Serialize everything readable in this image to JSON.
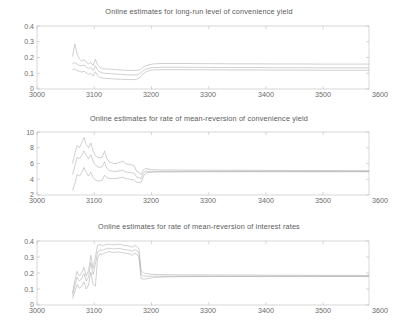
{
  "figure": {
    "background": "#ffffff",
    "axis_color": "#b9b9b9",
    "line_color": "#a8a8a8",
    "text_color": "#6b6b6b",
    "width": 398,
    "height": 325
  },
  "panels": [
    {
      "title": "Online estimates for long-run level of convenience yield",
      "yticks": [
        "0",
        "0.1",
        "0.2",
        "0.3",
        "0.4"
      ],
      "xticks": [
        "3000",
        "3100",
        "3200",
        "3300",
        "3400",
        "3500",
        "3600"
      ]
    },
    {
      "title": "Online estimates for rate of mean-reversion of convenience yield",
      "yticks": [
        "2",
        "4",
        "6",
        "8",
        "10"
      ],
      "xticks": [
        "3000",
        "3100",
        "3200",
        "3300",
        "3400",
        "3500",
        "3600"
      ]
    },
    {
      "title": "Online estimates for rate of mean-reversion of interest rates",
      "yticks": [
        "0",
        "0.1",
        "0.2",
        "0.3",
        "0.4"
      ],
      "xticks": [
        "3000",
        "3100",
        "3200",
        "3300",
        "3400",
        "3500",
        "3600"
      ]
    }
  ],
  "chart_data": [
    {
      "type": "line",
      "title": "Online estimates for long-run level of convenience yield",
      "xlabel": "",
      "ylabel": "",
      "xlim": [
        3000,
        3580
      ],
      "ylim": [
        0,
        0.4
      ],
      "xticks": [
        3000,
        3100,
        3200,
        3300,
        3400,
        3500,
        3600
      ],
      "yticks": [
        0,
        0.1,
        0.2,
        0.3,
        0.4
      ],
      "grid": false,
      "legend": "none",
      "x": [
        3062,
        3066,
        3070,
        3074,
        3078,
        3082,
        3086,
        3090,
        3094,
        3098,
        3102,
        3106,
        3110,
        3114,
        3118,
        3122,
        3126,
        3130,
        3134,
        3138,
        3142,
        3146,
        3150,
        3154,
        3158,
        3162,
        3166,
        3170,
        3174,
        3178,
        3182,
        3186,
        3190,
        3194,
        3198,
        3202,
        3206,
        3212,
        3220,
        3240,
        3260,
        3280,
        3300,
        3340,
        3380,
        3420,
        3460,
        3500,
        3540,
        3580
      ],
      "series": [
        {
          "name": "upper band",
          "values": [
            0.205,
            0.285,
            0.225,
            0.19,
            0.178,
            0.186,
            0.172,
            0.16,
            0.168,
            0.15,
            0.188,
            0.152,
            0.138,
            0.13,
            0.128,
            0.127,
            0.126,
            0.125,
            0.124,
            0.123,
            0.122,
            0.121,
            0.12,
            0.119,
            0.118,
            0.118,
            0.117,
            0.117,
            0.118,
            0.12,
            0.128,
            0.14,
            0.148,
            0.152,
            0.156,
            0.158,
            0.16,
            0.161,
            0.162,
            0.162,
            0.162,
            0.161,
            0.161,
            0.16,
            0.16,
            0.159,
            0.159,
            0.158,
            0.158,
            0.158
          ]
        },
        {
          "name": "estimate",
          "values": [
            0.16,
            0.168,
            0.158,
            0.15,
            0.148,
            0.152,
            0.14,
            0.128,
            0.138,
            0.118,
            0.148,
            0.12,
            0.108,
            0.102,
            0.1,
            0.099,
            0.098,
            0.097,
            0.096,
            0.095,
            0.094,
            0.093,
            0.092,
            0.091,
            0.09,
            0.09,
            0.089,
            0.089,
            0.09,
            0.094,
            0.104,
            0.118,
            0.126,
            0.13,
            0.133,
            0.135,
            0.136,
            0.137,
            0.138,
            0.138,
            0.138,
            0.137,
            0.137,
            0.136,
            0.136,
            0.135,
            0.135,
            0.134,
            0.134,
            0.134
          ]
        },
        {
          "name": "lower band",
          "values": [
            0.12,
            0.128,
            0.118,
            0.112,
            0.108,
            0.112,
            0.104,
            0.092,
            0.1,
            0.082,
            0.11,
            0.086,
            0.074,
            0.07,
            0.068,
            0.067,
            0.066,
            0.065,
            0.064,
            0.063,
            0.062,
            0.062,
            0.061,
            0.061,
            0.06,
            0.06,
            0.06,
            0.06,
            0.062,
            0.068,
            0.082,
            0.098,
            0.108,
            0.114,
            0.118,
            0.12,
            0.121,
            0.122,
            0.123,
            0.123,
            0.123,
            0.122,
            0.122,
            0.121,
            0.121,
            0.12,
            0.12,
            0.119,
            0.119,
            0.119
          ]
        }
      ]
    },
    {
      "type": "line",
      "title": "Online estimates for rate of mean-reversion of convenience yield",
      "xlabel": "",
      "ylabel": "",
      "xlim": [
        3000,
        3580
      ],
      "ylim": [
        2,
        10
      ],
      "xticks": [
        3000,
        3100,
        3200,
        3300,
        3400,
        3500,
        3600
      ],
      "yticks": [
        2,
        4,
        6,
        8,
        10
      ],
      "grid": false,
      "legend": "none",
      "x": [
        3062,
        3066,
        3070,
        3074,
        3078,
        3082,
        3086,
        3090,
        3094,
        3098,
        3102,
        3106,
        3110,
        3114,
        3118,
        3122,
        3126,
        3130,
        3134,
        3138,
        3142,
        3146,
        3150,
        3154,
        3158,
        3162,
        3166,
        3170,
        3174,
        3178,
        3182,
        3186,
        3190,
        3194,
        3198,
        3202,
        3210,
        3230,
        3260,
        3300,
        3340,
        3380,
        3420,
        3460,
        3500,
        3540,
        3580
      ],
      "series": [
        {
          "name": "upper band",
          "values": [
            6.0,
            7.2,
            8.3,
            8.0,
            8.6,
            9.3,
            8.4,
            8.0,
            8.6,
            7.6,
            7.0,
            6.8,
            6.7,
            6.8,
            7.6,
            6.6,
            6.2,
            6.1,
            6.0,
            6.0,
            6.1,
            6.2,
            6.3,
            6.0,
            5.9,
            5.9,
            5.8,
            5.7,
            5.0,
            4.9,
            4.6,
            5.2,
            5.4,
            5.3,
            5.25,
            5.22,
            5.2,
            5.18,
            5.16,
            5.15,
            5.14,
            5.13,
            5.12,
            5.11,
            5.1,
            5.09,
            5.08
          ]
        },
        {
          "name": "estimate",
          "values": [
            4.6,
            5.6,
            6.8,
            6.6,
            7.0,
            7.6,
            7.0,
            6.6,
            7.1,
            6.3,
            5.8,
            5.6,
            5.5,
            5.6,
            6.2,
            5.4,
            5.1,
            5.05,
            5.0,
            5.0,
            5.05,
            5.1,
            5.15,
            4.95,
            4.9,
            4.85,
            4.8,
            4.75,
            4.3,
            4.2,
            4.1,
            4.8,
            5.05,
            5.02,
            5.0,
            5.0,
            5.0,
            5.0,
            5.0,
            5.0,
            5.0,
            5.0,
            5.0,
            5.0,
            5.0,
            5.0,
            5.0
          ]
        },
        {
          "name": "lower band",
          "values": [
            2.6,
            3.4,
            4.6,
            4.4,
            4.8,
            5.5,
            4.9,
            4.4,
            4.9,
            4.2,
            3.9,
            3.8,
            3.8,
            3.9,
            4.5,
            4.2,
            4.1,
            4.1,
            4.1,
            4.1,
            4.15,
            4.2,
            4.25,
            4.1,
            4.05,
            4.0,
            3.95,
            3.9,
            3.6,
            3.6,
            3.6,
            4.4,
            4.8,
            4.85,
            4.88,
            4.9,
            4.92,
            4.93,
            4.94,
            4.95,
            4.95,
            4.95,
            4.95,
            4.95,
            4.95,
            4.95,
            4.95
          ]
        }
      ]
    },
    {
      "type": "line",
      "title": "Online estimates for rate of mean-reversion of interest rates",
      "xlabel": "",
      "ylabel": "",
      "xlim": [
        3000,
        3580
      ],
      "ylim": [
        0,
        0.4
      ],
      "xticks": [
        3000,
        3100,
        3200,
        3300,
        3400,
        3500,
        3600
      ],
      "yticks": [
        0,
        0.1,
        0.2,
        0.3,
        0.4
      ],
      "grid": false,
      "legend": "none",
      "x": [
        3062,
        3066,
        3070,
        3074,
        3078,
        3082,
        3086,
        3090,
        3094,
        3098,
        3102,
        3106,
        3110,
        3114,
        3118,
        3122,
        3126,
        3130,
        3134,
        3138,
        3142,
        3146,
        3150,
        3154,
        3158,
        3162,
        3166,
        3170,
        3174,
        3178,
        3182,
        3186,
        3190,
        3194,
        3198,
        3202,
        3206,
        3214,
        3230,
        3260,
        3300,
        3340,
        3380,
        3420,
        3460,
        3500,
        3540,
        3580
      ],
      "series": [
        {
          "name": "upper band",
          "values": [
            0.075,
            0.15,
            0.21,
            0.18,
            0.2,
            0.235,
            0.18,
            0.215,
            0.31,
            0.23,
            0.3,
            0.375,
            0.378,
            0.37,
            0.375,
            0.378,
            0.38,
            0.378,
            0.376,
            0.378,
            0.38,
            0.378,
            0.374,
            0.372,
            0.37,
            0.368,
            0.36,
            0.372,
            0.368,
            0.35,
            0.215,
            0.2,
            0.196,
            0.194,
            0.192,
            0.192,
            0.191,
            0.19,
            0.189,
            0.188,
            0.188,
            0.187,
            0.187,
            0.186,
            0.186,
            0.185,
            0.185,
            0.185
          ]
        },
        {
          "name": "estimate",
          "values": [
            0.06,
            0.12,
            0.175,
            0.15,
            0.165,
            0.195,
            0.15,
            0.175,
            0.265,
            0.19,
            0.255,
            0.33,
            0.345,
            0.34,
            0.348,
            0.352,
            0.355,
            0.352,
            0.35,
            0.352,
            0.354,
            0.352,
            0.348,
            0.346,
            0.344,
            0.342,
            0.335,
            0.346,
            0.342,
            0.325,
            0.19,
            0.182,
            0.18,
            0.179,
            0.179,
            0.18,
            0.18,
            0.18,
            0.18,
            0.18,
            0.18,
            0.18,
            0.18,
            0.18,
            0.18,
            0.18,
            0.18,
            0.18
          ]
        },
        {
          "name": "lower band",
          "values": [
            0.04,
            0.082,
            0.128,
            0.105,
            0.115,
            0.145,
            0.1,
            0.125,
            0.205,
            0.13,
            0.118,
            0.295,
            0.32,
            0.315,
            0.325,
            0.33,
            0.334,
            0.33,
            0.328,
            0.33,
            0.332,
            0.33,
            0.326,
            0.324,
            0.322,
            0.32,
            0.31,
            0.322,
            0.318,
            0.3,
            0.165,
            0.162,
            0.163,
            0.165,
            0.168,
            0.17,
            0.172,
            0.174,
            0.176,
            0.177,
            0.178,
            0.178,
            0.178,
            0.178,
            0.178,
            0.178,
            0.178,
            0.178
          ]
        }
      ]
    }
  ]
}
